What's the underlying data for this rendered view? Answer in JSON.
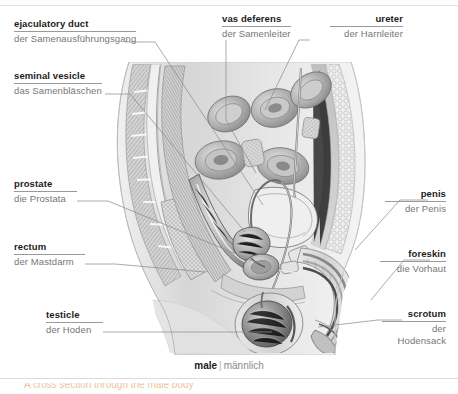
{
  "page": {
    "width": 458,
    "height": 394,
    "background": "#ffffff"
  },
  "caption": {
    "english": "male",
    "separator": "|",
    "german": "männlich"
  },
  "illustration": {
    "title": "male-reproductive-system-sagittal-section",
    "style": "grayscale engraving / medical cross-section",
    "colors": {
      "ink": "#6f6f6f",
      "midtone": "#b9b9b9",
      "skin": "#dcdcdc",
      "highlight": "#f2f2f2"
    }
  },
  "labels": [
    {
      "id": "ejaculatory-duct",
      "english": "ejaculatory duct",
      "german": "der Samenausführungsgang",
      "align": "left",
      "x": 14,
      "y": 20
    },
    {
      "id": "seminal-vesicle",
      "english": "seminal vesicle",
      "german": "das Samenbläschen",
      "align": "left",
      "x": 14,
      "y": 72
    },
    {
      "id": "prostate",
      "english": "prostate",
      "german": "die Prostata",
      "align": "left",
      "x": 14,
      "y": 180
    },
    {
      "id": "rectum",
      "english": "rectum",
      "german": "der Mastdarm",
      "align": "left",
      "x": 14,
      "y": 243
    },
    {
      "id": "testicle",
      "english": "testicle",
      "german": "der Hoden",
      "align": "left",
      "x": 46,
      "y": 311
    },
    {
      "id": "vas-deferens",
      "english": "vas deferens",
      "german": "der Samenleiter",
      "align": "left",
      "x": 222,
      "y": 15
    },
    {
      "id": "ureter",
      "english": "ureter",
      "german": "der Harnleiter",
      "align": "right",
      "x": 403,
      "y": 15
    },
    {
      "id": "penis",
      "english": "penis",
      "german": "der Penis",
      "align": "right",
      "x": 446,
      "y": 190
    },
    {
      "id": "foreskin",
      "english": "foreskin",
      "german": "die Vorhaut",
      "align": "right",
      "x": 446,
      "y": 250
    },
    {
      "id": "scrotum",
      "english": "scrotum",
      "german": "der\nHodensack",
      "german_line1": "der",
      "german_line2": "Hodensack",
      "align": "right",
      "x": 446,
      "y": 310
    }
  ],
  "footer": {
    "clipped_text": "A cross section through the male body",
    "corner_note": ""
  }
}
